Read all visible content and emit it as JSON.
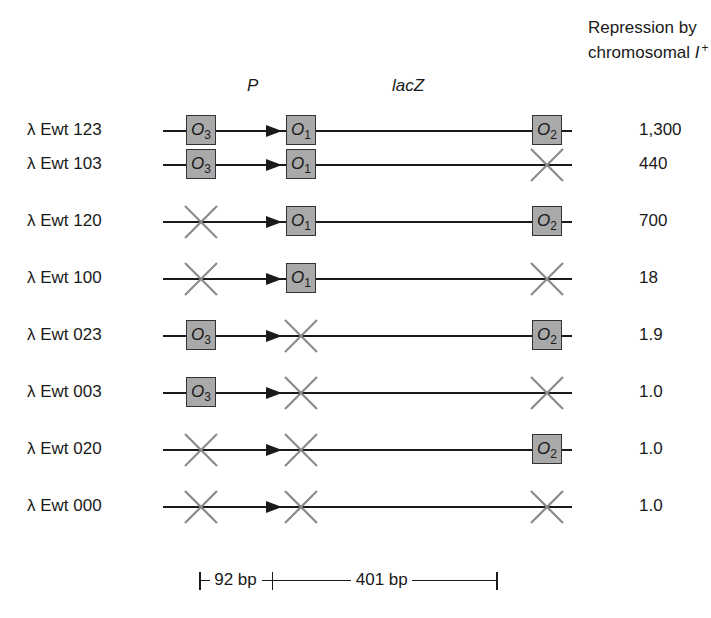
{
  "header": {
    "repression_line1": "Repression by",
    "repression_line2": "chromosomal",
    "repression_italic": "I",
    "repression_sup": "+"
  },
  "gene_labels": {
    "promoter": "P",
    "gene": "lacZ"
  },
  "operator_labels": {
    "o3": {
      "letter": "O",
      "sub": "3"
    },
    "o1": {
      "letter": "O",
      "sub": "1"
    },
    "o2": {
      "letter": "O",
      "sub": "2"
    }
  },
  "rows": [
    {
      "label": "λ Ewt 123",
      "o3": true,
      "o1": true,
      "o2": true,
      "value": "1,300"
    },
    {
      "label": "λ Ewt 103",
      "o3": true,
      "o1": true,
      "o2": false,
      "value": "440"
    },
    {
      "label": "λ Ewt 120",
      "o3": false,
      "o1": true,
      "o2": true,
      "value": "700"
    },
    {
      "label": "λ Ewt 100",
      "o3": false,
      "o1": true,
      "o2": false,
      "value": "18"
    },
    {
      "label": "λ Ewt 023",
      "o3": true,
      "o1": false,
      "o2": true,
      "value": "1.9"
    },
    {
      "label": "λ Ewt 003",
      "o3": true,
      "o1": false,
      "o2": false,
      "value": "1.0"
    },
    {
      "label": "λ Ewt 020",
      "o3": false,
      "o1": false,
      "o2": true,
      "value": "1.0"
    },
    {
      "label": "λ Ewt 000",
      "o3": false,
      "o1": false,
      "o2": false,
      "value": "1.0"
    }
  ],
  "scale": {
    "segment1": "92 bp",
    "segment2": "401 bp"
  },
  "colors": {
    "operator_fill": "#a9a9a9",
    "deletion_x": "#8a8a8a",
    "line": "#1a1a1a"
  }
}
